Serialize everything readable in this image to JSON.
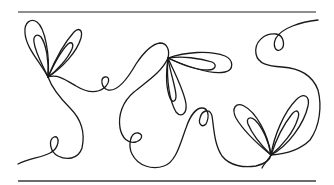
{
  "colors": {
    "background": "#ffffff",
    "stroke": "#1a1a1a",
    "rule": "#666666"
  },
  "elements": {
    "top_rule": "horizontal rule top",
    "bottom_rule": "horizontal rule bottom",
    "left_flower": "two-petal looped flower",
    "center_flower": "three-petal looped flower",
    "right_flower": "two-petal looped flower"
  }
}
